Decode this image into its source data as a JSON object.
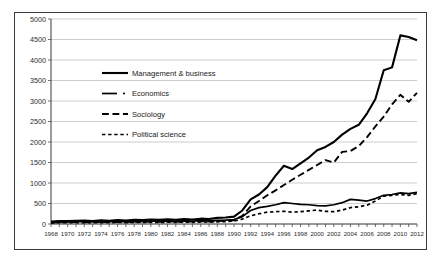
{
  "chart_data": {
    "type": "line",
    "title": "",
    "xlabel": "",
    "ylabel": "",
    "xlim": [
      1968,
      2012
    ],
    "ylim": [
      0,
      5000
    ],
    "ytick_step": 500,
    "xtick_step": 1,
    "xlabel_step": 2,
    "grid": true,
    "legend_position": "upper-left-inside",
    "ytick_labels": [
      "0",
      "500",
      "1000",
      "1500",
      "2000",
      "2500",
      "3000",
      "3500",
      "4000",
      "4500",
      "5000"
    ],
    "ytick_values": [
      0,
      500,
      1000,
      1500,
      2000,
      2500,
      3000,
      3500,
      4000,
      4500,
      5000
    ],
    "x": [
      1968,
      1969,
      1970,
      1971,
      1972,
      1973,
      1974,
      1975,
      1976,
      1977,
      1978,
      1979,
      1980,
      1981,
      1982,
      1983,
      1984,
      1985,
      1986,
      1987,
      1988,
      1989,
      1990,
      1991,
      1992,
      1993,
      1994,
      1995,
      1996,
      1997,
      1998,
      1999,
      2000,
      2001,
      2002,
      2003,
      2004,
      2005,
      2006,
      2007,
      2008,
      2009,
      2010,
      2011,
      2012
    ],
    "xtick_labels": [
      "1968",
      "1970",
      "1972",
      "1974",
      "1976",
      "1978",
      "1980",
      "1982",
      "1984",
      "1986",
      "1988",
      "1990",
      "1992",
      "1994",
      "1996",
      "1998",
      "2000",
      "2002",
      "2004",
      "2006",
      "2008",
      "2010",
      "2012"
    ],
    "series": [
      {
        "name": "Management & business",
        "style": "solid",
        "color": "#000000",
        "width": 2.1,
        "values": [
          60,
          75,
          70,
          80,
          85,
          70,
          90,
          80,
          95,
          85,
          100,
          95,
          110,
          100,
          115,
          105,
          120,
          110,
          130,
          120,
          150,
          160,
          180,
          330,
          600,
          720,
          900,
          1180,
          1420,
          1340,
          1480,
          1620,
          1800,
          1880,
          2000,
          2180,
          2320,
          2420,
          2700,
          3050,
          3750,
          3820,
          4600,
          4560,
          4480
        ]
      },
      {
        "name": "Economics",
        "style": "solid-dot",
        "color": "#000000",
        "width": 1.7,
        "values": [
          40,
          50,
          55,
          60,
          55,
          58,
          62,
          58,
          65,
          60,
          70,
          65,
          72,
          68,
          75,
          70,
          78,
          72,
          82,
          78,
          90,
          95,
          110,
          180,
          330,
          400,
          430,
          470,
          520,
          500,
          480,
          470,
          450,
          440,
          470,
          520,
          600,
          580,
          560,
          620,
          700,
          720,
          760,
          740,
          770
        ]
      },
      {
        "name": "Sociology",
        "style": "long-dash",
        "color": "#000000",
        "width": 1.9,
        "values": [
          35,
          42,
          45,
          48,
          44,
          46,
          50,
          46,
          52,
          48,
          55,
          52,
          58,
          54,
          60,
          56,
          62,
          58,
          66,
          62,
          72,
          78,
          90,
          200,
          430,
          560,
          700,
          820,
          950,
          1080,
          1200,
          1320,
          1440,
          1560,
          1500,
          1760,
          1780,
          1900,
          2120,
          2380,
          2620,
          2920,
          3150,
          2980,
          3200
        ]
      },
      {
        "name": "Political science",
        "style": "short-dash",
        "color": "#000000",
        "width": 1.7,
        "values": [
          25,
          30,
          32,
          35,
          30,
          32,
          35,
          32,
          38,
          34,
          40,
          36,
          42,
          38,
          44,
          40,
          46,
          42,
          50,
          46,
          54,
          58,
          70,
          120,
          200,
          250,
          290,
          300,
          310,
          290,
          300,
          320,
          340,
          310,
          300,
          340,
          400,
          420,
          460,
          560,
          680,
          700,
          720,
          700,
          740
        ]
      }
    ]
  },
  "legend": {
    "items": [
      {
        "label": "Management & business",
        "style": "solid"
      },
      {
        "label": "Economics",
        "style": "solid-dot"
      },
      {
        "label": "Sociology",
        "style": "long-dash"
      },
      {
        "label": "Political science",
        "style": "short-dash"
      }
    ]
  }
}
